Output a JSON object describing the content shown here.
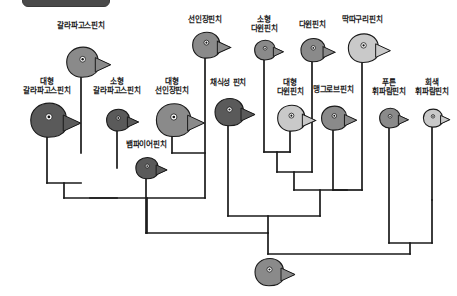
{
  "figure": {
    "kind": "cladogram",
    "root_label": "",
    "line_color": "#1a1a1a",
    "bird_fill_dark": "#5a5a5a",
    "bird_fill_mid": "#8a8a8a",
    "bird_fill_light": "#c9c9c9",
    "background": "#ffffff"
  },
  "top_bar": {
    "present": true,
    "color": "#4a4a4a"
  },
  "taxa": [
    {
      "id": "t1",
      "label": "대형\n갈라파고스핀치",
      "label_x": 8,
      "label_y": 78,
      "label_w": 78,
      "head_x": 47,
      "head_y": 120,
      "size": 1.25,
      "tone": "dark",
      "tip_x": 47,
      "tip_y": 131
    },
    {
      "id": "t2",
      "label": "갈라파고스핀치",
      "label_x": 42,
      "label_y": 22,
      "label_w": 78,
      "head_x": 81,
      "head_y": 62,
      "size": 1.1,
      "tone": "mid",
      "tip_x": 81,
      "tip_y": 73
    },
    {
      "id": "t3",
      "label": "소형\n갈라파고스핀치",
      "label_x": 78,
      "label_y": 78,
      "label_w": 78,
      "head_x": 117,
      "head_y": 120,
      "size": 0.8,
      "tone": "dark",
      "tip_x": 117,
      "tip_y": 128
    },
    {
      "id": "t4",
      "label": "뱀파이어핀치",
      "label_x": 113,
      "label_y": 141,
      "label_w": 66,
      "head_x": 146,
      "head_y": 168,
      "size": 0.78,
      "tone": "dark",
      "tip_x": 146,
      "tip_y": 176
    },
    {
      "id": "t5",
      "label": "대형\n선인장핀치",
      "label_x": 143,
      "label_y": 78,
      "label_w": 58,
      "head_x": 172,
      "head_y": 120,
      "size": 1.2,
      "tone": "mid",
      "tip_x": 172,
      "tip_y": 131
    },
    {
      "id": "t6",
      "label": "선인장핀치",
      "label_x": 178,
      "label_y": 16,
      "label_w": 54,
      "head_x": 205,
      "head_y": 45,
      "size": 0.95,
      "tone": "mid",
      "tip_x": 205,
      "tip_y": 54
    },
    {
      "id": "t7",
      "label": "채식성 핀치",
      "label_x": 199,
      "label_y": 79,
      "label_w": 58,
      "head_x": 228,
      "head_y": 112,
      "size": 1.0,
      "tone": "dark",
      "tip_x": 228,
      "tip_y": 122
    },
    {
      "id": "t8",
      "label": "소형\n다윈핀치",
      "label_x": 238,
      "label_y": 16,
      "label_w": 52,
      "head_x": 264,
      "head_y": 50,
      "size": 0.72,
      "tone": "mid",
      "tip_x": 264,
      "tip_y": 57
    },
    {
      "id": "t9",
      "label": "대형\n다윈핀치",
      "label_x": 263,
      "label_y": 79,
      "label_w": 54,
      "head_x": 290,
      "head_y": 118,
      "size": 0.95,
      "tone": "light",
      "tip_x": 290,
      "tip_y": 127
    },
    {
      "id": "t10",
      "label": "다윈핀치",
      "label_x": 287,
      "label_y": 21,
      "label_w": 50,
      "head_x": 312,
      "head_y": 50,
      "size": 0.85,
      "tone": "mid",
      "tip_x": 312,
      "tip_y": 58
    },
    {
      "id": "t11",
      "label": "맹그로브핀치",
      "label_x": 301,
      "label_y": 86,
      "label_w": 64,
      "head_x": 333,
      "head_y": 118,
      "size": 0.88,
      "tone": "mid",
      "tip_x": 333,
      "tip_y": 127
    },
    {
      "id": "t12",
      "label": "딱따구리핀치",
      "label_x": 330,
      "label_y": 16,
      "label_w": 64,
      "head_x": 362,
      "head_y": 48,
      "size": 1.05,
      "tone": "light",
      "tip_x": 362,
      "tip_y": 58
    },
    {
      "id": "t13",
      "label": "푸른\n휘파람핀치",
      "label_x": 361,
      "label_y": 79,
      "label_w": 56,
      "head_x": 389,
      "head_y": 118,
      "size": 0.72,
      "tone": "mid",
      "tip_x": 389,
      "tip_y": 125
    },
    {
      "id": "t14",
      "label": "회색\n휘파람핀치",
      "label_x": 405,
      "label_y": 79,
      "label_w": 54,
      "head_x": 432,
      "head_y": 118,
      "size": 0.66,
      "tone": "light",
      "tip_x": 432,
      "tip_y": 124
    }
  ],
  "ancestor": {
    "head_x": 268,
    "head_y": 272,
    "size": 1.0,
    "tone": "mid",
    "stem_x": 268,
    "stem_top": 254,
    "stem_bottom": 264
  },
  "branches": {
    "segments": [
      {
        "name": "tip-t1",
        "x1": 47,
        "y1": 131,
        "x2": 47,
        "y2": 183
      },
      {
        "name": "tip-t2",
        "x1": 81,
        "y1": 73,
        "x2": 81,
        "y2": 153
      },
      {
        "name": "tip-t3",
        "x1": 117,
        "y1": 128,
        "x2": 117,
        "y2": 168
      },
      {
        "name": "tip-t4",
        "x1": 146,
        "y1": 176,
        "x2": 146,
        "y2": 233
      },
      {
        "name": "tip-t5",
        "x1": 172,
        "y1": 131,
        "x2": 172,
        "y2": 153
      },
      {
        "name": "tip-t6",
        "x1": 205,
        "y1": 54,
        "x2": 205,
        "y2": 198
      },
      {
        "name": "tip-t7",
        "x1": 228,
        "y1": 122,
        "x2": 228,
        "y2": 216
      },
      {
        "name": "tip-t8",
        "x1": 264,
        "y1": 57,
        "x2": 264,
        "y2": 152
      },
      {
        "name": "tip-t9",
        "x1": 290,
        "y1": 127,
        "x2": 290,
        "y2": 152
      },
      {
        "name": "tip-t10",
        "x1": 312,
        "y1": 58,
        "x2": 312,
        "y2": 172
      },
      {
        "name": "tip-t11",
        "x1": 333,
        "y1": 127,
        "x2": 333,
        "y2": 190
      },
      {
        "name": "tip-t12",
        "x1": 362,
        "y1": 58,
        "x2": 362,
        "y2": 190
      },
      {
        "name": "tip-t13",
        "x1": 389,
        "y1": 125,
        "x2": 389,
        "y2": 243
      },
      {
        "name": "tip-t14",
        "x1": 432,
        "y1": 124,
        "x2": 432,
        "y2": 200
      },
      {
        "name": "node-A-bar",
        "x1": 47,
        "y1": 183,
        "x2": 81,
        "y2": 183
      },
      {
        "name": "node-A-stem",
        "x1": 64,
        "y1": 183,
        "x2": 64,
        "y2": 198
      },
      {
        "name": "node-B-bar",
        "x1": 64,
        "y1": 198,
        "x2": 117,
        "y2": 198
      },
      {
        "name": "node-B-stem",
        "x1": 90,
        "y1": 198,
        "x2": 90,
        "y2": 198
      },
      {
        "name": "node-C-bar",
        "x1": 90,
        "y1": 198,
        "x2": 205,
        "y2": 198
      },
      {
        "name": "node-C-stem",
        "x1": 147,
        "y1": 198,
        "x2": 147,
        "y2": 233
      },
      {
        "name": "node-D-bar",
        "x1": 172,
        "y1": 153,
        "x2": 205,
        "y2": 153
      },
      {
        "name": "node-E-bar",
        "x1": 146,
        "y1": 233,
        "x2": 268,
        "y2": 233
      },
      {
        "name": "node-F-bar",
        "x1": 264,
        "y1": 152,
        "x2": 290,
        "y2": 152
      },
      {
        "name": "node-F-stem",
        "x1": 277,
        "y1": 152,
        "x2": 277,
        "y2": 172
      },
      {
        "name": "node-G-bar",
        "x1": 277,
        "y1": 172,
        "x2": 312,
        "y2": 172
      },
      {
        "name": "node-G-stem",
        "x1": 294,
        "y1": 172,
        "x2": 294,
        "y2": 190
      },
      {
        "name": "node-H-bar",
        "x1": 333,
        "y1": 190,
        "x2": 362,
        "y2": 190
      },
      {
        "name": "node-I-bar",
        "x1": 294,
        "y1": 190,
        "x2": 347,
        "y2": 190
      },
      {
        "name": "node-I-stem",
        "x1": 320,
        "y1": 190,
        "x2": 320,
        "y2": 216
      },
      {
        "name": "node-J-bar",
        "x1": 228,
        "y1": 216,
        "x2": 320,
        "y2": 216
      },
      {
        "name": "node-J-stem",
        "x1": 268,
        "y1": 216,
        "x2": 268,
        "y2": 233
      },
      {
        "name": "node-K-bar",
        "x1": 389,
        "y1": 243,
        "x2": 432,
        "y2": 243
      },
      {
        "name": "node-K-left",
        "x1": 432,
        "y1": 200,
        "x2": 432,
        "y2": 243
      },
      {
        "name": "node-K-stem",
        "x1": 410,
        "y1": 243,
        "x2": 410,
        "y2": 254
      },
      {
        "name": "root-bar",
        "x1": 268,
        "y1": 254,
        "x2": 410,
        "y2": 254
      },
      {
        "name": "root-left-stem",
        "x1": 268,
        "y1": 233,
        "x2": 268,
        "y2": 254
      }
    ]
  }
}
